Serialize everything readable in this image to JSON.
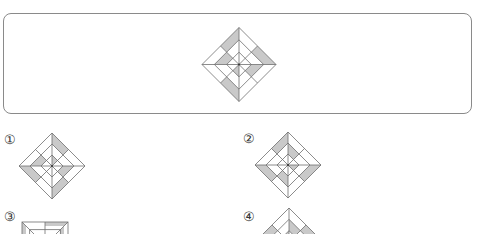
{
  "question": {
    "figure": {
      "shape": "diamond",
      "center": [
        239,
        64.5
      ],
      "radius": 37,
      "shaded_cells": [
        {
          "ring": 2,
          "vertex": "T",
          "edge": "UL"
        },
        {
          "ring": 2,
          "vertex": "R",
          "edge": "UR"
        },
        {
          "ring": 2,
          "vertex": "B",
          "edge": "LL"
        },
        {
          "ring": 1,
          "vertex": "L",
          "edge": "UL"
        },
        {
          "ring": 1,
          "vertex": "R",
          "edge": "LR"
        },
        {
          "ring": 0,
          "vertex": "B",
          "edge": "LL"
        }
      ]
    }
  },
  "options": [
    {
      "label": "①",
      "label_pos": [
        4,
        133
      ],
      "figure": {
        "shape": "diamond",
        "center": [
          52,
          166
        ],
        "radius": 33,
        "shaded_cells": [
          {
            "ring": 2,
            "vertex": "T",
            "edge": "UR"
          },
          {
            "ring": 2,
            "vertex": "L",
            "edge": "LL"
          },
          {
            "ring": 2,
            "vertex": "B",
            "edge": "LR"
          },
          {
            "ring": 1,
            "vertex": "L",
            "edge": "UL"
          },
          {
            "ring": 1,
            "vertex": "R",
            "edge": "LR"
          },
          {
            "ring": 0,
            "vertex": "T",
            "edge": "UR"
          }
        ]
      }
    },
    {
      "label": "②",
      "label_pos": [
        243,
        132
      ],
      "figure": {
        "shape": "diamond",
        "center": [
          288,
          165
        ],
        "radius": 33,
        "shaded_cells": [
          {
            "ring": 2,
            "vertex": "T",
            "edge": "UL"
          },
          {
            "ring": 2,
            "vertex": "L",
            "edge": "LL"
          },
          {
            "ring": 2,
            "vertex": "R",
            "edge": "LR"
          },
          {
            "ring": 1,
            "vertex": "T",
            "edge": "UR"
          },
          {
            "ring": 1,
            "vertex": "B",
            "edge": "LL"
          },
          {
            "ring": 0,
            "vertex": "R",
            "edge": "LR"
          }
        ]
      }
    },
    {
      "label": "③",
      "label_pos": [
        4,
        210
      ],
      "figure": {
        "shape": "square",
        "origin": [
          22,
          222
        ],
        "size": 46
      }
    },
    {
      "label": "④",
      "label_pos": [
        243,
        210
      ],
      "figure": {
        "shape": "diamond",
        "center": [
          289,
          242
        ],
        "radius": 34,
        "shaded_cells": [
          {
            "ring": 2,
            "vertex": "L",
            "edge": "UL"
          },
          {
            "ring": 2,
            "vertex": "R",
            "edge": "UR"
          },
          {
            "ring": 1,
            "vertex": "T",
            "edge": "UR"
          },
          {
            "ring": 0,
            "vertex": "T",
            "edge": "UL"
          }
        ]
      }
    }
  ],
  "colors": {
    "line": "#6e6e6e",
    "shade": "#c9c9c9",
    "box_border": "#8a8a8a"
  }
}
